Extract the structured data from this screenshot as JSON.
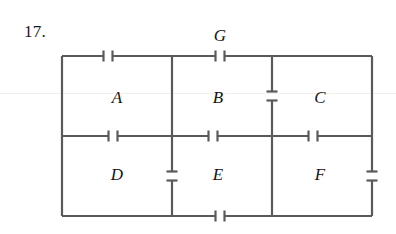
{
  "page": {
    "problem_number": "17.",
    "background_color": "#ffffff",
    "line_color": "#5a5a5a",
    "text_color": "#141414"
  },
  "figure": {
    "type": "capacitor-network-diagram",
    "frame": {
      "x": 62,
      "y": 56,
      "width": 310,
      "height": 160
    },
    "region_labels": [
      {
        "id": "A",
        "label": "A",
        "x": 117,
        "y": 98
      },
      {
        "id": "B",
        "label": "B",
        "x": 218,
        "y": 98
      },
      {
        "id": "C",
        "label": "C",
        "x": 320,
        "y": 98
      },
      {
        "id": "D",
        "label": "D",
        "x": 117,
        "y": 175
      },
      {
        "id": "E",
        "label": "E",
        "x": 218,
        "y": 175
      },
      {
        "id": "F",
        "label": "F",
        "x": 320,
        "y": 175
      },
      {
        "id": "G",
        "label": "G",
        "x": 220,
        "y": 36
      }
    ],
    "geometry": {
      "left_x": 62,
      "right_x": 372,
      "top_y": 56,
      "mid_y": 136,
      "bottom_y": 216,
      "div_ab_x": 172,
      "div_bc_x": 272
    },
    "capacitors": [
      {
        "name": "cap-top-left",
        "orientation": "horizontal",
        "cx": 108,
        "cy": 56,
        "plate": 11,
        "gap": 9
      },
      {
        "name": "cap-top-g",
        "orientation": "horizontal",
        "cx": 220,
        "cy": 56,
        "plate": 11,
        "gap": 9
      },
      {
        "name": "cap-mid-1",
        "orientation": "horizontal",
        "cx": 113,
        "cy": 136,
        "plate": 11,
        "gap": 9
      },
      {
        "name": "cap-mid-2",
        "orientation": "horizontal",
        "cx": 213,
        "cy": 136,
        "plate": 11,
        "gap": 9
      },
      {
        "name": "cap-mid-3",
        "orientation": "horizontal",
        "cx": 313,
        "cy": 136,
        "plate": 11,
        "gap": 9
      },
      {
        "name": "cap-bottom",
        "orientation": "horizontal",
        "cx": 220,
        "cy": 216,
        "plate": 11,
        "gap": 9
      },
      {
        "name": "cap-div-ab-lower",
        "orientation": "vertical",
        "cx": 172,
        "cy": 176,
        "plate": 11,
        "gap": 9
      },
      {
        "name": "cap-div-bc-upper",
        "orientation": "vertical",
        "cx": 272,
        "cy": 96,
        "plate": 11,
        "gap": 9
      },
      {
        "name": "cap-right-lower",
        "orientation": "vertical",
        "cx": 372,
        "cy": 176,
        "plate": 11,
        "gap": 9
      }
    ]
  }
}
